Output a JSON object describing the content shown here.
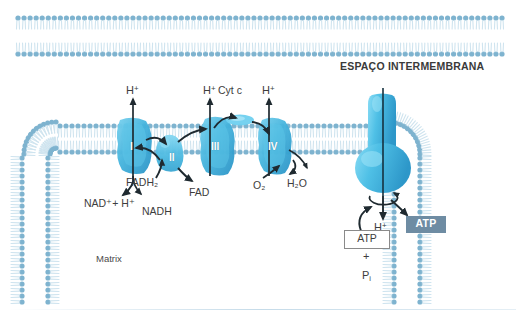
{
  "diagram": {
    "regions": {
      "intermembrane_space": "ESPAÇO INTERMEMBRANA",
      "matrix": "Matrix"
    },
    "colors": {
      "membrane_head": "#7eb3cf",
      "membrane_tail": "#cfe4ef",
      "complex_fill": "#49b6dd",
      "complex_fill_dark": "#2e93c4",
      "atp_badge_bg": "#6e8ca3",
      "atp_badge_text": "#ffffff",
      "text": "#3d3d3d",
      "background": "#ffffff"
    },
    "complexes": [
      {
        "id": "complex-i",
        "label": "I",
        "x": 132,
        "y": 146
      },
      {
        "id": "complex-ii",
        "label": "II",
        "x": 173,
        "y": 155
      },
      {
        "id": "complex-iii",
        "label": "III",
        "x": 215,
        "y": 146
      },
      {
        "id": "complex-iv",
        "label": "IV",
        "x": 272,
        "y": 146
      },
      {
        "id": "atp-synthase",
        "label": "",
        "x": 383,
        "y": 146
      }
    ],
    "proton_labels": [
      {
        "id": "h-plus-complex-i",
        "text": "H",
        "charge": "+",
        "x": 126,
        "y": 86
      },
      {
        "id": "h-plus-complex-iii",
        "text": "H",
        "charge": "+",
        "x": 203,
        "y": 86
      },
      {
        "id": "h-plus-complex-iv",
        "text": "H",
        "charge": "+",
        "x": 262,
        "y": 86
      },
      {
        "id": "h-plus-atp-synthase",
        "text": "H",
        "charge": "+",
        "x": 374,
        "y": 222
      }
    ],
    "molecule_labels": [
      {
        "id": "nad-plus-h-plus",
        "text": "NAD⁺+ H⁺",
        "x": 86,
        "y": 197
      },
      {
        "id": "nadh",
        "text": "NADH",
        "x": 142,
        "y": 206
      },
      {
        "id": "fadh2",
        "text": "FADH₂",
        "x": 128,
        "y": 177
      },
      {
        "id": "fad",
        "text": "FAD",
        "x": 190,
        "y": 187
      },
      {
        "id": "cyt-c",
        "text": "Cyt c",
        "x": 219,
        "y": 85
      },
      {
        "id": "o2",
        "text": "O₂",
        "x": 254,
        "y": 180
      },
      {
        "id": "h2o",
        "text": "H₂O",
        "x": 288,
        "y": 178
      }
    ],
    "atp_nodes": {
      "substrate_box": {
        "id": "adp-box",
        "label": "ATP",
        "x": 349,
        "y": 233
      },
      "plus_sign": {
        "id": "plus-sign",
        "label": "+",
        "x": 367,
        "y": 253
      },
      "phosphate": {
        "id": "inorganic-phosphate",
        "text": "P",
        "subscript": "i",
        "x": 366,
        "y": 272
      },
      "product_badge": {
        "id": "atp-badge",
        "label": "ATP",
        "x": 410,
        "y": 219
      }
    }
  }
}
